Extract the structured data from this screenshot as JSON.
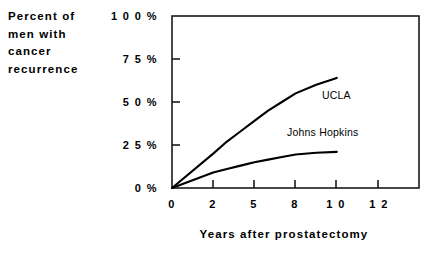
{
  "chart_data": {
    "type": "line",
    "title": "",
    "xlabel": "Years after prostatectomy",
    "ylabel": "Percent of men with cancer recurrence",
    "ylabel_lines": [
      "Percent of",
      "men with",
      "cancer",
      "recurrence"
    ],
    "x_tick_labels": [
      "0",
      "2",
      "5",
      "8",
      "1 0",
      "1 2"
    ],
    "x_tick_values": [
      0,
      2,
      5,
      8,
      10,
      12
    ],
    "y_tick_labels": [
      "1 0 0 %",
      "7 5 %",
      "5 0 %",
      "2 5 %",
      "0 %"
    ],
    "y_tick_values": [
      100,
      75,
      50,
      25,
      0
    ],
    "ylim": [
      0,
      100
    ],
    "xlim": [
      0,
      12
    ],
    "grid": false,
    "legend_position": "inline-annotation",
    "line_color": "#000000",
    "series": [
      {
        "name": "UCLA",
        "x": [
          0,
          2,
          3,
          4,
          5,
          6,
          7,
          8,
          9,
          10
        ],
        "values": [
          0,
          20,
          27,
          33,
          39,
          45,
          50,
          55,
          60,
          64
        ]
      },
      {
        "name": "Johns Hopkins",
        "x": [
          0,
          2,
          3,
          4,
          5,
          6,
          7,
          8,
          9,
          10
        ],
        "values": [
          0,
          9,
          11,
          13,
          15,
          16.5,
          18,
          19.5,
          20.5,
          21
        ]
      }
    ]
  }
}
